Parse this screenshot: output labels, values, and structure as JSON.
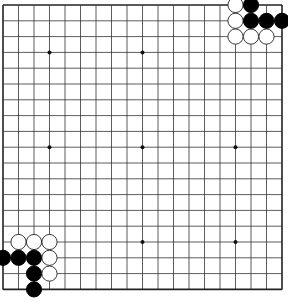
{
  "board": {
    "size": 19,
    "origin": {
      "x": 3,
      "y": 5
    },
    "spacing": {
      "x": 15.5,
      "y": 15.8
    },
    "line_color": "#333333",
    "border_color": "#222222",
    "hoshi": [
      [
        3,
        3
      ],
      [
        9,
        3
      ],
      [
        3,
        9
      ],
      [
        9,
        9
      ],
      [
        15,
        9
      ],
      [
        9,
        15
      ],
      [
        15,
        15
      ]
    ],
    "stones": [
      {
        "color": "white",
        "col": 15,
        "row": 0
      },
      {
        "color": "black",
        "col": 16,
        "row": 0
      },
      {
        "color": "white",
        "col": 15,
        "row": 1
      },
      {
        "color": "black",
        "col": 16,
        "row": 1
      },
      {
        "color": "black",
        "col": 17,
        "row": 1
      },
      {
        "color": "black",
        "col": 18,
        "row": 1
      },
      {
        "color": "white",
        "col": 15,
        "row": 2
      },
      {
        "color": "white",
        "col": 16,
        "row": 2
      },
      {
        "color": "white",
        "col": 17,
        "row": 2
      },
      {
        "color": "white",
        "col": 1,
        "row": 15
      },
      {
        "color": "white",
        "col": 2,
        "row": 15
      },
      {
        "color": "white",
        "col": 3,
        "row": 15
      },
      {
        "color": "black",
        "col": 0,
        "row": 16
      },
      {
        "color": "black",
        "col": 1,
        "row": 16
      },
      {
        "color": "black",
        "col": 2,
        "row": 16
      },
      {
        "color": "white",
        "col": 3,
        "row": 16
      },
      {
        "color": "black",
        "col": 2,
        "row": 17
      },
      {
        "color": "white",
        "col": 3,
        "row": 17
      },
      {
        "color": "black",
        "col": 2,
        "row": 18
      }
    ]
  }
}
